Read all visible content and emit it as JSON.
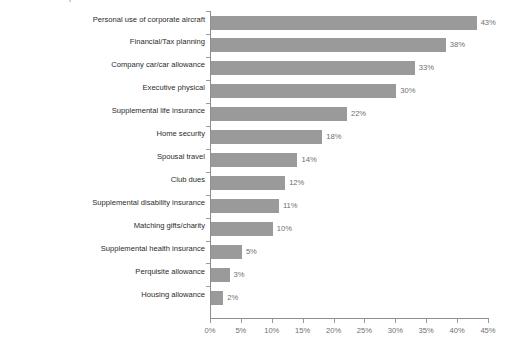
{
  "clipped_title_fragment": "Executive Perquisites",
  "chart_data": {
    "type": "bar",
    "orientation": "horizontal",
    "title": "",
    "xlabel": "",
    "ylabel": "",
    "xlim": [
      0,
      45
    ],
    "grid": false,
    "legend": false,
    "bar_color": "#9a9a9a",
    "axis_color": "#8e8e8e",
    "label_color": "#2b2b2b",
    "value_color": "#6f6f6f",
    "categories": [
      "Personal use of corporate aircraft",
      "Financial/Tax planning",
      "Company car/car allowance",
      "Executive physical",
      "Supplemental life insurance",
      "Home security",
      "Spousal travel",
      "Club dues",
      "Supplemental disability insurance",
      "Matching gifts/charity",
      "Supplemental health insurance",
      "Perquisite allowance",
      "Housing allowance"
    ],
    "values": [
      43,
      38,
      33,
      30,
      22,
      18,
      14,
      12,
      11,
      10,
      5,
      3,
      2
    ],
    "value_labels": [
      "43%",
      "38%",
      "33%",
      "30%",
      "22%",
      "18%",
      "14%",
      "12%",
      "11%",
      "10%",
      "5%",
      "3%",
      "2%"
    ],
    "xticks": [
      0,
      5,
      10,
      15,
      20,
      25,
      30,
      35,
      40,
      45
    ],
    "xtick_labels": [
      "0%",
      "5%",
      "10%",
      "15%",
      "20%",
      "25%",
      "30%",
      "35%",
      "40%",
      "45%"
    ]
  }
}
